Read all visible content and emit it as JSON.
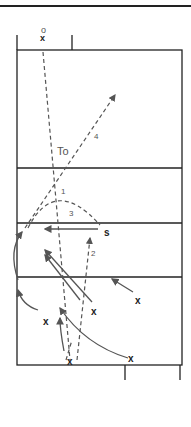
{
  "diagram": {
    "type": "volleyball-court-play",
    "labels": {
      "server_o": "o",
      "server_x": "x",
      "to": "To",
      "setter": "s",
      "path1": "1",
      "path2": "2",
      "path3": "3",
      "path4": "4"
    },
    "players": [
      {
        "id": "p1",
        "label": "x"
      },
      {
        "id": "p2",
        "label": "x"
      },
      {
        "id": "p3",
        "label": "x"
      },
      {
        "id": "p4",
        "label": "x"
      },
      {
        "id": "p5",
        "label": "x"
      }
    ],
    "colors": {
      "court_line": "#222222",
      "path": "#555555",
      "background": "#ffffff"
    }
  }
}
